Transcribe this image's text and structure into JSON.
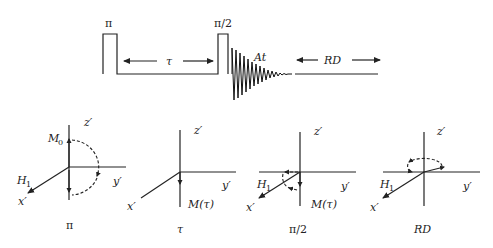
{
  "pulse_sequence": {
    "pulse1_label": "π",
    "delay_label": "τ",
    "pulse2_label": "π/2",
    "acquisition_label": "At",
    "relaxation_label": "RD"
  },
  "vector_diagrams": [
    {
      "caption": "π",
      "axis_z": "z′",
      "axis_y": "y′",
      "axis_x": "x′",
      "field_label": "H",
      "field_sub": "1",
      "magnetization_label": "M",
      "magnetization_sub": "0"
    },
    {
      "caption": "τ",
      "axis_z": "z′",
      "axis_y": "y′",
      "axis_x": "x′",
      "magnetization_label": "M(τ)"
    },
    {
      "caption": "π/2",
      "axis_z": "z′",
      "axis_y": "y′",
      "axis_x": "x′",
      "field_label": "H",
      "field_sub": "1",
      "magnetization_label": "M(τ)"
    },
    {
      "caption": "RD",
      "axis_z": "z′",
      "axis_y": "y′",
      "axis_x": "x′",
      "field_label": "H",
      "field_sub": "1"
    }
  ]
}
